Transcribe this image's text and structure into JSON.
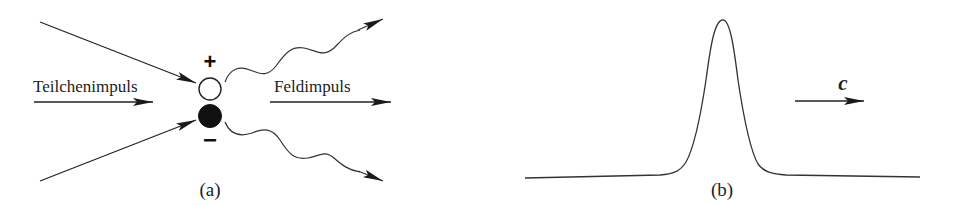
{
  "panel_a": {
    "caption": "(a)",
    "particle_momentum_label": "Teilchenimpuls",
    "field_momentum_label": "Feldimpuls",
    "positive_charge_sign": "+",
    "negative_charge_sign": "−",
    "positive_particle": "open-circle",
    "negative_particle": "filled-circle"
  },
  "panel_b": {
    "caption": "(b)",
    "velocity_label": "c",
    "curve": "localized pulse (bell-shaped) on flat baseline"
  },
  "colors": {
    "stroke": "#222222",
    "background": "#ffffff"
  }
}
